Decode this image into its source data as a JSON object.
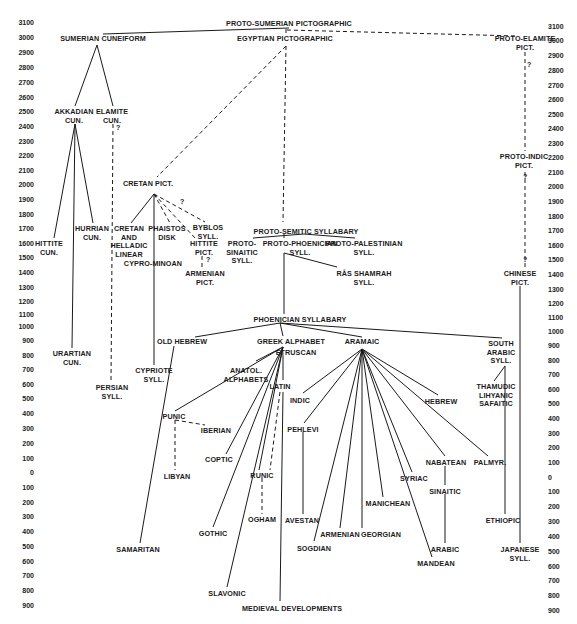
{
  "axis": {
    "left_ticks": [
      {
        "label": "3100",
        "y": 22
      },
      {
        "label": "3000",
        "y": 37
      },
      {
        "label": "2900",
        "y": 52
      },
      {
        "label": "2800",
        "y": 67
      },
      {
        "label": "2700",
        "y": 82
      },
      {
        "label": "2600",
        "y": 97
      },
      {
        "label": "2500",
        "y": 111
      },
      {
        "label": "2400",
        "y": 126
      },
      {
        "label": "2300",
        "y": 141
      },
      {
        "label": "2200",
        "y": 155
      },
      {
        "label": "2100",
        "y": 170
      },
      {
        "label": "2000",
        "y": 184
      },
      {
        "label": "1900",
        "y": 199
      },
      {
        "label": "1800",
        "y": 214
      },
      {
        "label": "1700",
        "y": 228
      },
      {
        "label": "1600",
        "y": 243
      },
      {
        "label": "1500",
        "y": 257
      },
      {
        "label": "1400",
        "y": 272
      },
      {
        "label": "1300",
        "y": 287
      },
      {
        "label": "1200",
        "y": 301
      },
      {
        "label": "1100",
        "y": 314
      },
      {
        "label": "1000",
        "y": 326
      },
      {
        "label": "900",
        "y": 340
      },
      {
        "label": "800",
        "y": 355
      },
      {
        "label": "700",
        "y": 369
      },
      {
        "label": "600",
        "y": 384
      },
      {
        "label": "500",
        "y": 398
      },
      {
        "label": "400",
        "y": 413
      },
      {
        "label": "300",
        "y": 428
      },
      {
        "label": "200",
        "y": 443
      },
      {
        "label": "100",
        "y": 458
      },
      {
        "label": "0",
        "y": 472
      },
      {
        "label": "100",
        "y": 487
      },
      {
        "label": "200",
        "y": 502
      },
      {
        "label": "300",
        "y": 516
      },
      {
        "label": "400",
        "y": 531
      },
      {
        "label": "500",
        "y": 546
      },
      {
        "label": "600",
        "y": 561
      },
      {
        "label": "700",
        "y": 575
      },
      {
        "label": "800",
        "y": 590
      },
      {
        "label": "900",
        "y": 605
      }
    ],
    "right_ticks": [
      {
        "label": "3100",
        "y": 26
      },
      {
        "label": "3000",
        "y": 40
      },
      {
        "label": "2900",
        "y": 55
      },
      {
        "label": "2800",
        "y": 70
      },
      {
        "label": "2700",
        "y": 85
      },
      {
        "label": "2600",
        "y": 99
      },
      {
        "label": "2500",
        "y": 114
      },
      {
        "label": "2400",
        "y": 128
      },
      {
        "label": "2300",
        "y": 143
      },
      {
        "label": "2200",
        "y": 157
      },
      {
        "label": "2100",
        "y": 172
      },
      {
        "label": "2000",
        "y": 186
      },
      {
        "label": "1900",
        "y": 201
      },
      {
        "label": "1800",
        "y": 216
      },
      {
        "label": "1700",
        "y": 230
      },
      {
        "label": "1600",
        "y": 245
      },
      {
        "label": "1500",
        "y": 259
      },
      {
        "label": "1400",
        "y": 274
      },
      {
        "label": "1300",
        "y": 289
      },
      {
        "label": "1200",
        "y": 303
      },
      {
        "label": "1100",
        "y": 317
      },
      {
        "label": "1000",
        "y": 331
      },
      {
        "label": "900",
        "y": 345
      },
      {
        "label": "800",
        "y": 360
      },
      {
        "label": "700",
        "y": 374
      },
      {
        "label": "600",
        "y": 389
      },
      {
        "label": "500",
        "y": 403
      },
      {
        "label": "400",
        "y": 418
      },
      {
        "label": "300",
        "y": 433
      },
      {
        "label": "200",
        "y": 447
      },
      {
        "label": "100",
        "y": 462
      },
      {
        "label": "0",
        "y": 477
      },
      {
        "label": "100",
        "y": 491
      },
      {
        "label": "200",
        "y": 506
      },
      {
        "label": "300",
        "y": 521
      },
      {
        "label": "400",
        "y": 536
      },
      {
        "label": "500",
        "y": 551
      },
      {
        "label": "600",
        "y": 566
      },
      {
        "label": "700",
        "y": 580
      },
      {
        "label": "800",
        "y": 595
      },
      {
        "label": "900",
        "y": 610
      }
    ]
  },
  "nodes": [
    {
      "id": "proto_sumerian",
      "text": "PROTO-SUMERIAN PICTOGRAPHIC",
      "x": 289,
      "y": 20
    },
    {
      "id": "sumerian",
      "text": "SUMERIAN  CUNEIFORM",
      "x": 103,
      "y": 35
    },
    {
      "id": "egyptian",
      "text": "EGYPTIAN PICTOGRAPHIC",
      "x": 285,
      "y": 35
    },
    {
      "id": "proto_elamite",
      "text": "PROTO-ELAMITE\nPICT.",
      "x": 525,
      "y": 35
    },
    {
      "id": "akkadian",
      "text": "AKKADIAN\nCUN.",
      "x": 74,
      "y": 108
    },
    {
      "id": "elamite",
      "text": "ELAMITE\nCUN.",
      "x": 112,
      "y": 108
    },
    {
      "id": "proto_indic",
      "text": "PROTO-INDIC\nPICT.",
      "x": 524,
      "y": 153
    },
    {
      "id": "cretan",
      "text": "CRETAN PICT.",
      "x": 148,
      "y": 180
    },
    {
      "id": "hurrian",
      "text": "HURRIAN\nCUN.",
      "x": 92,
      "y": 225
    },
    {
      "id": "cretan_helladic",
      "text": "CRETAN\nAND\nHELLADIC\nLINEAR",
      "x": 129,
      "y": 225
    },
    {
      "id": "phaistos",
      "text": "PHAISTOS\nDISK",
      "x": 167,
      "y": 225
    },
    {
      "id": "byblos",
      "text": "BYBLOS\nSYLL.",
      "x": 208,
      "y": 224
    },
    {
      "id": "proto_semitic",
      "text": "PROTO-SEMITIC SYLLABARY",
      "x": 306,
      "y": 228
    },
    {
      "id": "hittite_cun",
      "text": "HITTITE\nCUN.",
      "x": 49,
      "y": 240
    },
    {
      "id": "hittite_pict",
      "text": "HITTITE\nPICT.",
      "x": 204,
      "y": 240
    },
    {
      "id": "proto_sinaitic",
      "text": "PROTO-\nSINAITIC\nSYLL.",
      "x": 242,
      "y": 240
    },
    {
      "id": "proto_phoenician",
      "text": "PROTO-PHOENICIAN\nSYLL.",
      "x": 300,
      "y": 240
    },
    {
      "id": "proto_palestinian",
      "text": "PROTO-PALESTINIAN\nSYLL.",
      "x": 364,
      "y": 240
    },
    {
      "id": "cypro_minoan",
      "text": "CYPRO-MINOAN",
      "x": 153,
      "y": 260
    },
    {
      "id": "armenian_pict",
      "text": "ARMENIAN\nPICT.",
      "x": 205,
      "y": 270
    },
    {
      "id": "ras_shamrah",
      "text": "RÂS SHAMRAH\nSYLL.",
      "x": 364,
      "y": 270
    },
    {
      "id": "chinese",
      "text": "CHINESE\nPICT.",
      "x": 520,
      "y": 270
    },
    {
      "id": "phoenician",
      "text": "PHOENICIAN SYLLABARY",
      "x": 300,
      "y": 316
    },
    {
      "id": "old_hebrew",
      "text": "OLD HEBREW",
      "x": 182,
      "y": 338
    },
    {
      "id": "greek",
      "text": "GREEK  ALPHABET",
      "x": 291,
      "y": 338
    },
    {
      "id": "aramaic",
      "text": "ARAMAIC",
      "x": 362,
      "y": 338
    },
    {
      "id": "south_arabic",
      "text": "SOUTH\nARABIC\nSYLL.",
      "x": 501,
      "y": 340
    },
    {
      "id": "etruscan",
      "text": "ETRUSCAN",
      "x": 296,
      "y": 349
    },
    {
      "id": "urartian",
      "text": "URARTIAN\nCUN.",
      "x": 72,
      "y": 350
    },
    {
      "id": "cypriote",
      "text": "CYPRIOTE\nSYLL.",
      "x": 154,
      "y": 367
    },
    {
      "id": "anatol",
      "text": "ANATOL.\nALPHABETS",
      "x": 246,
      "y": 367
    },
    {
      "id": "latin",
      "text": "LATIN",
      "x": 280,
      "y": 383
    },
    {
      "id": "indic",
      "text": "INDIC",
      "x": 300,
      "y": 397
    },
    {
      "id": "thamudic",
      "text": "THAMUDIC\nLIHYANIC\nSAFAITIC",
      "x": 496,
      "y": 383
    },
    {
      "id": "hebrew",
      "text": "HEBREW",
      "x": 441,
      "y": 398
    },
    {
      "id": "persian",
      "text": "PERSIAN\nSYLL.",
      "x": 112,
      "y": 384
    },
    {
      "id": "punic",
      "text": "PUNIC",
      "x": 174,
      "y": 413
    },
    {
      "id": "pehlevi",
      "text": "PEHLEVI",
      "x": 303,
      "y": 426
    },
    {
      "id": "iberian",
      "text": "IBERIAN",
      "x": 216,
      "y": 427
    },
    {
      "id": "coptic",
      "text": "COPTIC",
      "x": 219,
      "y": 456
    },
    {
      "id": "nabatean",
      "text": "NABATEAN",
      "x": 446,
      "y": 459
    },
    {
      "id": "palmyr",
      "text": "PALMYR.",
      "x": 490,
      "y": 459
    },
    {
      "id": "libyan",
      "text": "LIBYAN",
      "x": 177,
      "y": 473
    },
    {
      "id": "syriac",
      "text": "SYRIAC",
      "x": 414,
      "y": 475
    },
    {
      "id": "runic",
      "text": "RUNIC",
      "x": 262,
      "y": 472
    },
    {
      "id": "sinaitic",
      "text": "SINAITIC",
      "x": 445,
      "y": 488
    },
    {
      "id": "manichean",
      "text": "MANICHEAN",
      "x": 388,
      "y": 500
    },
    {
      "id": "ogham",
      "text": "OGHAM",
      "x": 262,
      "y": 516
    },
    {
      "id": "avestan",
      "text": "AVESTAN",
      "x": 302,
      "y": 517
    },
    {
      "id": "ethiopic",
      "text": "ETHIOPIC",
      "x": 503,
      "y": 517
    },
    {
      "id": "gothic",
      "text": "GOTHIC",
      "x": 213,
      "y": 530
    },
    {
      "id": "armenian",
      "text": "ARMENIAN",
      "x": 340,
      "y": 531
    },
    {
      "id": "georgian",
      "text": "GEORGIAN",
      "x": 381,
      "y": 531
    },
    {
      "id": "sogdian",
      "text": "SOGDIAN",
      "x": 314,
      "y": 545
    },
    {
      "id": "arabic",
      "text": "ARABIC",
      "x": 445,
      "y": 546
    },
    {
      "id": "japanese",
      "text": "JAPANESE\nSYLL.",
      "x": 520,
      "y": 546
    },
    {
      "id": "samaritan",
      "text": "SAMARITAN",
      "x": 138,
      "y": 546
    },
    {
      "id": "mandean",
      "text": "MANDEAN",
      "x": 436,
      "y": 560
    },
    {
      "id": "slavonic",
      "text": "SLAVONIC",
      "x": 227,
      "y": 590
    },
    {
      "id": "medieval",
      "text": "MEDIEVAL DEVELOPMENTS",
      "x": 292,
      "y": 605
    }
  ],
  "question_marks": [
    {
      "x": 116,
      "y": 124,
      "text": "?"
    },
    {
      "x": 527,
      "y": 61,
      "text": "?"
    },
    {
      "x": 523,
      "y": 173,
      "text": "?"
    },
    {
      "x": 180,
      "y": 198,
      "text": "?"
    },
    {
      "x": 206,
      "y": 256,
      "text": "?"
    },
    {
      "x": 523,
      "y": 256,
      "text": "?"
    }
  ],
  "edges": [
    {
      "x1": 103,
      "y1": 34,
      "x2": 289,
      "y2": 28,
      "dash": false
    },
    {
      "x1": 287,
      "y1": 30,
      "x2": 518,
      "y2": 36,
      "dash": true
    },
    {
      "x1": 286,
      "y1": 29,
      "x2": 286,
      "y2": 34,
      "dash": true
    },
    {
      "x1": 97,
      "y1": 45,
      "x2": 75,
      "y2": 106,
      "dash": false
    },
    {
      "x1": 97,
      "y1": 45,
      "x2": 113,
      "y2": 106,
      "dash": false
    },
    {
      "x1": 286,
      "y1": 46,
      "x2": 157,
      "y2": 177,
      "dash": true
    },
    {
      "x1": 286,
      "y1": 46,
      "x2": 283,
      "y2": 222,
      "dash": true
    },
    {
      "x1": 525,
      "y1": 52,
      "x2": 525,
      "y2": 151,
      "dash": true
    },
    {
      "x1": 525,
      "y1": 172,
      "x2": 525,
      "y2": 268,
      "dash": true
    },
    {
      "x1": 113,
      "y1": 124,
      "x2": 111,
      "y2": 382,
      "dash": true
    },
    {
      "x1": 75,
      "y1": 124,
      "x2": 54,
      "y2": 238,
      "dash": false
    },
    {
      "x1": 75,
      "y1": 124,
      "x2": 93,
      "y2": 223,
      "dash": false
    },
    {
      "x1": 75,
      "y1": 124,
      "x2": 72,
      "y2": 348,
      "dash": false
    },
    {
      "x1": 154,
      "y1": 194,
      "x2": 131,
      "y2": 223,
      "dash": false
    },
    {
      "x1": 154,
      "y1": 194,
      "x2": 154,
      "y2": 365,
      "dash": false
    },
    {
      "x1": 154,
      "y1": 194,
      "x2": 170,
      "y2": 223,
      "dash": true
    },
    {
      "x1": 154,
      "y1": 194,
      "x2": 195,
      "y2": 238,
      "dash": true
    },
    {
      "x1": 154,
      "y1": 194,
      "x2": 205,
      "y2": 222,
      "dash": true
    },
    {
      "x1": 202,
      "y1": 256,
      "x2": 202,
      "y2": 268,
      "dash": true
    },
    {
      "x1": 253,
      "y1": 238,
      "x2": 304,
      "y2": 234,
      "dash": false
    },
    {
      "x1": 304,
      "y1": 234,
      "x2": 355,
      "y2": 238,
      "dash": false
    },
    {
      "x1": 284,
      "y1": 234,
      "x2": 284,
      "y2": 238,
      "dash": false
    },
    {
      "x1": 284,
      "y1": 253,
      "x2": 337,
      "y2": 267,
      "dash": false
    },
    {
      "x1": 284,
      "y1": 253,
      "x2": 284,
      "y2": 314,
      "dash": false
    },
    {
      "x1": 195,
      "y1": 337,
      "x2": 280,
      "y2": 323,
      "dash": false
    },
    {
      "x1": 280,
      "y1": 323,
      "x2": 283,
      "y2": 336,
      "dash": false
    },
    {
      "x1": 280,
      "y1": 323,
      "x2": 362,
      "y2": 337,
      "dash": false
    },
    {
      "x1": 280,
      "y1": 323,
      "x2": 502,
      "y2": 338,
      "dash": false
    },
    {
      "x1": 283,
      "y1": 347,
      "x2": 175,
      "y2": 411,
      "dash": false
    },
    {
      "x1": 283,
      "y1": 347,
      "x2": 256,
      "y2": 361,
      "dash": false
    },
    {
      "x1": 283,
      "y1": 347,
      "x2": 226,
      "y2": 454,
      "dash": false
    },
    {
      "x1": 283,
      "y1": 347,
      "x2": 213,
      "y2": 527,
      "dash": false
    },
    {
      "x1": 283,
      "y1": 347,
      "x2": 227,
      "y2": 587,
      "dash": false
    },
    {
      "x1": 283,
      "y1": 347,
      "x2": 259,
      "y2": 470,
      "dash": false
    },
    {
      "x1": 283,
      "y1": 355,
      "x2": 283,
      "y2": 380,
      "dash": false
    },
    {
      "x1": 280,
      "y1": 392,
      "x2": 270,
      "y2": 470,
      "dash": true
    },
    {
      "x1": 262,
      "y1": 478,
      "x2": 262,
      "y2": 514,
      "dash": true
    },
    {
      "x1": 283,
      "y1": 392,
      "x2": 280,
      "y2": 601,
      "dash": false
    },
    {
      "x1": 174,
      "y1": 346,
      "x2": 140,
      "y2": 543,
      "dash": false
    },
    {
      "x1": 175,
      "y1": 420,
      "x2": 175,
      "y2": 470,
      "dash": true
    },
    {
      "x1": 175,
      "y1": 420,
      "x2": 205,
      "y2": 425,
      "dash": true
    },
    {
      "x1": 362,
      "y1": 349,
      "x2": 303,
      "y2": 393,
      "dash": false
    },
    {
      "x1": 362,
      "y1": 349,
      "x2": 304,
      "y2": 423,
      "dash": false
    },
    {
      "x1": 362,
      "y1": 349,
      "x2": 314,
      "y2": 541,
      "dash": false
    },
    {
      "x1": 362,
      "y1": 349,
      "x2": 340,
      "y2": 528,
      "dash": false
    },
    {
      "x1": 362,
      "y1": 349,
      "x2": 362,
      "y2": 528,
      "dash": false
    },
    {
      "x1": 362,
      "y1": 349,
      "x2": 383,
      "y2": 497,
      "dash": false
    },
    {
      "x1": 362,
      "y1": 349,
      "x2": 412,
      "y2": 472,
      "dash": false
    },
    {
      "x1": 362,
      "y1": 349,
      "x2": 432,
      "y2": 557,
      "dash": false
    },
    {
      "x1": 362,
      "y1": 349,
      "x2": 445,
      "y2": 456,
      "dash": false
    },
    {
      "x1": 362,
      "y1": 349,
      "x2": 488,
      "y2": 456,
      "dash": false
    },
    {
      "x1": 362,
      "y1": 349,
      "x2": 438,
      "y2": 395,
      "dash": false
    },
    {
      "x1": 303,
      "y1": 432,
      "x2": 303,
      "y2": 514,
      "dash": false
    },
    {
      "x1": 445,
      "y1": 466,
      "x2": 445,
      "y2": 485,
      "dash": false
    },
    {
      "x1": 445,
      "y1": 494,
      "x2": 445,
      "y2": 543,
      "dash": false
    },
    {
      "x1": 505,
      "y1": 366,
      "x2": 494,
      "y2": 381,
      "dash": false
    },
    {
      "x1": 505,
      "y1": 366,
      "x2": 505,
      "y2": 514,
      "dash": false
    },
    {
      "x1": 520,
      "y1": 286,
      "x2": 520,
      "y2": 543,
      "dash": false
    }
  ],
  "colors": {
    "ink": "#1a1a1a",
    "background": "#ffffff"
  }
}
